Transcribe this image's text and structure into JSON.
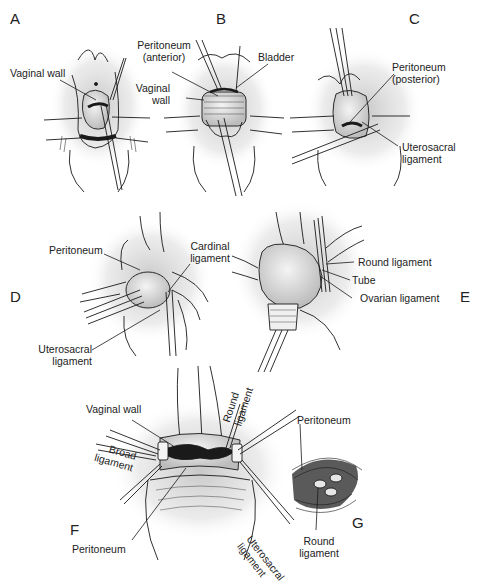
{
  "figure": {
    "colors": {
      "ink": "#1a1a1a",
      "tissue_shade": "#bdbdbd",
      "background": "#ffffff"
    },
    "panels": [
      {
        "id": "A",
        "letter": "A",
        "labels": [
          "Vaginal wall"
        ]
      },
      {
        "id": "B",
        "letter": "B",
        "labels": [
          "Peritoneum\n(anterior)",
          "Bladder",
          "Vaginal\nwall"
        ]
      },
      {
        "id": "C",
        "letter": "C",
        "labels": [
          "Peritoneum\n(posterior)",
          "Uterosacral\nligament"
        ]
      },
      {
        "id": "D",
        "letter": "D",
        "labels": [
          "Peritoneum",
          "Cardinal\nligament",
          "Uterosacral\nligament"
        ]
      },
      {
        "id": "E",
        "letter": "E",
        "labels": [
          "Round ligament",
          "Tube",
          "Ovarian ligament"
        ]
      },
      {
        "id": "F",
        "letter": "F",
        "labels": [
          "Vaginal wall",
          "Round\nligament",
          "Broad\nligament",
          "Peritoneum",
          "Uterosacral\nligament"
        ]
      },
      {
        "id": "G",
        "letter": "G",
        "labels": [
          "Peritoneum",
          "Round\nligament"
        ]
      }
    ]
  },
  "labels": {
    "A": {
      "letter": "A",
      "vaginal_wall": "Vaginal wall"
    },
    "B": {
      "letter": "B",
      "peritoneum_l1": "Peritoneum",
      "peritoneum_l2": "(anterior)",
      "bladder": "Bladder",
      "vaginal_l1": "Vaginal",
      "vaginal_l2": "wall"
    },
    "C": {
      "letter": "C",
      "peritoneum_l1": "Peritoneum",
      "peritoneum_l2": "(posterior)",
      "utero_l1": "Uterosacral",
      "utero_l2": "ligament"
    },
    "D": {
      "letter": "D",
      "peritoneum": "Peritoneum",
      "cardinal_l1": "Cardinal",
      "cardinal_l2": "ligament",
      "utero_l1": "Uterosacral",
      "utero_l2": "ligament"
    },
    "E": {
      "letter": "E",
      "round": "Round ligament",
      "tube": "Tube",
      "ovarian": "Ovarian ligament"
    },
    "F": {
      "letter": "F",
      "vaginal_wall": "Vaginal wall",
      "round_l1": "Round",
      "round_l2": "ligament",
      "broad_l1": "Broad",
      "broad_l2": "ligament",
      "peritoneum": "Peritoneum",
      "utero_l1": "Uterosacral",
      "utero_l2": "ligament"
    },
    "G": {
      "letter": "G",
      "peritoneum": "Peritoneum",
      "round_l1": "Round",
      "round_l2": "ligament"
    }
  }
}
